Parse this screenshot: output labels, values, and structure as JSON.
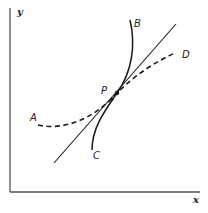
{
  "diagram": {
    "type": "tangent-curves",
    "axes": {
      "x_label": "x",
      "y_label": "y"
    },
    "point": {
      "label": "P"
    },
    "curves": [
      {
        "id": "B-C",
        "start_label": "B",
        "end_label": "C",
        "style": "solid",
        "description": "steep curve passing through P"
      },
      {
        "id": "A-D",
        "start_label": "A",
        "end_label": "D",
        "style": "dashed",
        "description": "shallow dashed curve passing through P"
      },
      {
        "id": "tangent",
        "style": "solid",
        "description": "straight tangent line through P"
      }
    ],
    "colors": {
      "stroke": "#1a1a1a",
      "axis": "#555555",
      "background": "#ffffff"
    }
  }
}
